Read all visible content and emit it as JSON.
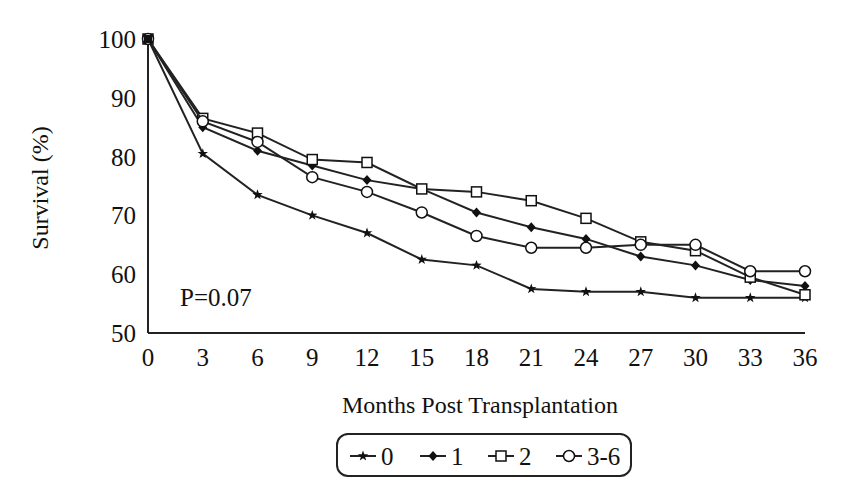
{
  "chart_data": {
    "type": "line",
    "title": "",
    "xlabel": "Months Post Transplantation",
    "ylabel": "Survival (%)",
    "x": [
      0,
      3,
      6,
      9,
      12,
      15,
      18,
      21,
      24,
      27,
      30,
      33,
      36
    ],
    "xticks": [
      "0",
      "3",
      "6",
      "9",
      "12",
      "15",
      "18",
      "21",
      "24",
      "27",
      "30",
      "33",
      "36"
    ],
    "yticks": [
      "50",
      "60",
      "70",
      "80",
      "90",
      "100"
    ],
    "ylim": [
      50,
      100
    ],
    "xlim": [
      0,
      36
    ],
    "grid": false,
    "legend_position": "bottom-center",
    "annotation": "P=0.07",
    "series": [
      {
        "name": "0",
        "marker": "star",
        "values": [
          100,
          80.5,
          73.5,
          70,
          67,
          62.5,
          61.5,
          57.5,
          57,
          57,
          56,
          56,
          56
        ]
      },
      {
        "name": "1",
        "marker": "filled-diamond",
        "values": [
          100,
          85,
          81,
          78.5,
          76,
          74.5,
          70.5,
          68,
          66,
          63,
          61.5,
          59,
          58
        ]
      },
      {
        "name": "2",
        "marker": "open-square",
        "values": [
          100,
          86.5,
          84,
          79.5,
          79,
          74.5,
          74,
          72.5,
          69.5,
          65.5,
          64,
          59.5,
          56.5
        ]
      },
      {
        "name": "3-6",
        "marker": "open-circle",
        "values": [
          100,
          86,
          82.5,
          76.5,
          74,
          70.5,
          66.5,
          64.5,
          64.5,
          65,
          65,
          60.5,
          60.5
        ]
      }
    ]
  },
  "legend": {
    "items": [
      {
        "label": "0"
      },
      {
        "label": "1"
      },
      {
        "label": "2"
      },
      {
        "label": "3-6"
      }
    ]
  }
}
